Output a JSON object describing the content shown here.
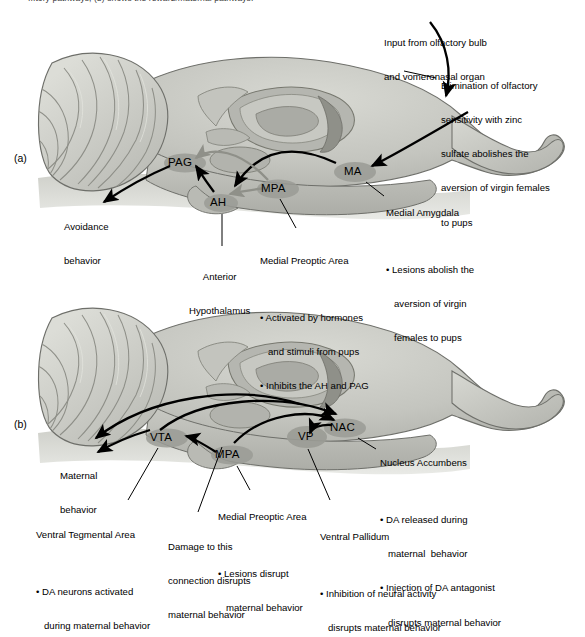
{
  "figure": {
    "clipped_top_caption": "...tory pathways; (b) shows the reward/maternal pathways.",
    "panel_a_letter": "(a)",
    "panel_b_letter": "(b)",
    "type": "neuroanatomy-schematic"
  },
  "colors": {
    "brain_fill": "#bfc0ba",
    "brain_fill_light": "#d2d3cd",
    "brain_fill_dark": "#a7a8a2",
    "nucleus_fill": "#9a9b95",
    "outline": "#6e6f6a",
    "excitatory_arrow": "#000000",
    "inhibitory_arrow": "#8f9089",
    "leader_line": "#000000",
    "text": "#000000",
    "background": "#ffffff"
  },
  "panel_a": {
    "letter": "(a)",
    "nuclei": [
      {
        "abbr": "PAG",
        "name": "Periaqueductal Gray"
      },
      {
        "abbr": "AH",
        "name": "Anterior Hypothalamus"
      },
      {
        "abbr": "MPA",
        "name": "Medial Preoptic Area"
      },
      {
        "abbr": "MA",
        "name": "Medial Amygdala"
      }
    ],
    "output_label": {
      "line1": "Avoidance",
      "line2": "behavior"
    },
    "annotations": [
      {
        "id": "input-olfactory",
        "lines": [
          "Input from olfactory bulb",
          "and vomeronasal organ"
        ]
      },
      {
        "id": "zinc-sulfate",
        "lines": [
          "Elimination of olfactory",
          "sensitivity with zinc",
          "sulfate abolishes the",
          "aversion of virgin females",
          "to pups"
        ]
      },
      {
        "id": "medial-amygdala",
        "title": "Medial Amygdala",
        "bullets": [
          "Lesions abolish the",
          "aversion of virgin",
          "females to pups"
        ]
      },
      {
        "id": "anterior-hypothalamus",
        "lines": [
          "Anterior",
          "Hypothalamus"
        ]
      },
      {
        "id": "medial-preoptic-area-a",
        "title": "Medial Preoptic Area",
        "bullets": [
          "Activated by hormones",
          "and stimuli from pups",
          "Inhibits the AH and PAG"
        ]
      }
    ]
  },
  "panel_b": {
    "letter": "(b)",
    "nuclei": [
      {
        "abbr": "VTA",
        "name": "Ventral Tegmental Area"
      },
      {
        "abbr": "MPA",
        "name": "Medial Preoptic Area"
      },
      {
        "abbr": "VP",
        "name": "Ventral Pallidum"
      },
      {
        "abbr": "NAC",
        "name": "Nucleus Accumbens"
      }
    ],
    "output_label": {
      "line1": "Maternal",
      "line2": "behavior"
    },
    "annotations": [
      {
        "id": "nucleus-accumbens",
        "title": "Nucleus Accumbens",
        "bullets": [
          "DA released during",
          "maternal  behavior",
          "Injection of DA antagonist",
          "disrupts maternal behavior"
        ]
      },
      {
        "id": "ventral-pallidum",
        "title": "Ventral Pallidum",
        "bullets": [
          "Inhibition of neural activity",
          "disrupts maternal behavior"
        ]
      },
      {
        "id": "medial-preoptic-area-b",
        "title": "Medial Preoptic Area",
        "bullets": [
          "Lesions disrupt",
          "maternal behavior"
        ]
      },
      {
        "id": "ventral-tegmental-area",
        "title": "Ventral Tegmental Area",
        "bullets": [
          "DA neurons activated",
          "during maternal behavior"
        ]
      },
      {
        "id": "damage-connection",
        "lines": [
          "Damage to this",
          "connection disrupts",
          "maternal behavior"
        ]
      }
    ]
  }
}
